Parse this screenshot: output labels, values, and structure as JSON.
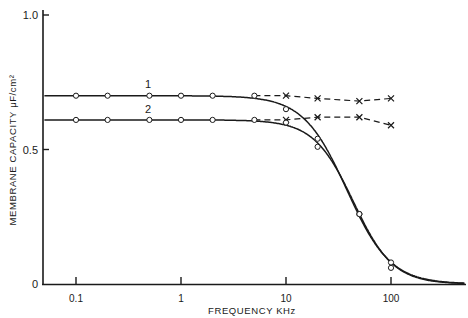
{
  "chart_data": {
    "type": "line",
    "title": "",
    "xlabel": "FREQUENCY   KHz",
    "ylabel": "MEMBRANE  CAPACITY    μF/cm²",
    "xscale": "log",
    "xlim": [
      0.05,
      500
    ],
    "ylim": [
      0,
      1.0
    ],
    "x_ticks": [
      0.1,
      1,
      10,
      100
    ],
    "x_tick_labels": [
      "0.1",
      "1",
      "10",
      "100"
    ],
    "y_ticks": [
      0,
      0.5,
      1.0
    ],
    "y_tick_labels": [
      "0",
      "0.5",
      "1.0"
    ],
    "grid": false,
    "legend": "none; curves labeled inline '1' and '2'",
    "series": [
      {
        "name": "1",
        "style": "solid line with open circles",
        "points": [
          [
            0.1,
            0.7
          ],
          [
            0.2,
            0.7
          ],
          [
            0.5,
            0.7
          ],
          [
            1,
            0.7
          ],
          [
            2,
            0.7
          ],
          [
            5,
            0.7
          ],
          [
            10,
            0.65
          ],
          [
            20,
            0.54
          ],
          [
            50,
            0.26
          ],
          [
            100,
            0.08
          ]
        ]
      },
      {
        "name": "2",
        "style": "solid line with open circles",
        "points": [
          [
            0.1,
            0.61
          ],
          [
            0.2,
            0.61
          ],
          [
            0.5,
            0.61
          ],
          [
            1,
            0.61
          ],
          [
            2,
            0.61
          ],
          [
            5,
            0.61
          ],
          [
            10,
            0.6
          ],
          [
            20,
            0.51
          ],
          [
            50,
            0.26
          ],
          [
            100,
            0.06
          ]
        ]
      },
      {
        "name": "1 (corrected)",
        "style": "dashed line with x markers",
        "points": [
          [
            5,
            0.7
          ],
          [
            10,
            0.7
          ],
          [
            20,
            0.69
          ],
          [
            50,
            0.68
          ],
          [
            100,
            0.69
          ]
        ]
      },
      {
        "name": "2 (corrected)",
        "style": "dashed line with x markers",
        "points": [
          [
            5,
            0.61
          ],
          [
            10,
            0.61
          ],
          [
            20,
            0.62
          ],
          [
            50,
            0.62
          ],
          [
            100,
            0.59
          ]
        ]
      }
    ],
    "annotations": [
      {
        "text": "1",
        "x": 1,
        "y": 0.72
      },
      {
        "text": "2",
        "x": 1,
        "y": 0.63
      }
    ]
  },
  "labels": {
    "ylabel": "MEMBRANE  CAPACITY    μF/cm²",
    "xlabel": "FREQUENCY   KHz"
  }
}
